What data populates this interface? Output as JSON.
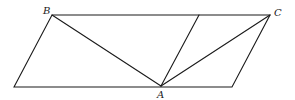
{
  "diagram": {
    "type": "geometry",
    "points": {
      "P1": {
        "x": 14,
        "y": 87,
        "label": ""
      },
      "B": {
        "x": 52,
        "y": 15,
        "label": "B"
      },
      "C": {
        "x": 270,
        "y": 15,
        "label": "C"
      },
      "P4": {
        "x": 232,
        "y": 87,
        "label": ""
      },
      "A": {
        "x": 161,
        "y": 86,
        "label": "A"
      },
      "M": {
        "x": 199,
        "y": 15,
        "label": ""
      }
    },
    "labels": {
      "A": "A",
      "B": "B",
      "C": "C"
    },
    "segments": [
      {
        "from": "P1",
        "to": "B"
      },
      {
        "from": "B",
        "to": "C"
      },
      {
        "from": "C",
        "to": "P4"
      },
      {
        "from": "P4",
        "to": "P1"
      },
      {
        "from": "A",
        "to": "B"
      },
      {
        "from": "A",
        "to": "M"
      },
      {
        "from": "A",
        "to": "C"
      }
    ],
    "colors": {
      "stroke": "#1a1a1a",
      "background": "#ffffff"
    }
  }
}
